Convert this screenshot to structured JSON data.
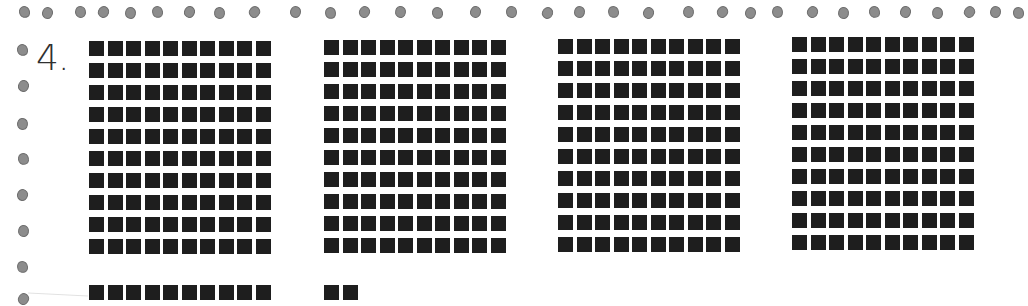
{
  "worksheet": {
    "problem_number": "4.",
    "representation": "base-ten blocks",
    "hundreds": 4,
    "tens": 1,
    "ones": 2,
    "block_color": "#1e1e1e",
    "border_dot_color": "#8c8c8c"
  },
  "blocks": {
    "hundreds": [
      {
        "left": 89,
        "top": 41
      },
      {
        "left": 324,
        "top": 40
      },
      {
        "left": 558,
        "top": 39
      },
      {
        "left": 792,
        "top": 37
      }
    ],
    "ten_rod": {
      "left": 89,
      "top": 285
    },
    "ones": {
      "left": 324,
      "top": 285
    }
  },
  "border": {
    "top_dots_x": [
      19,
      42,
      75,
      98,
      125,
      152,
      184,
      214,
      249,
      290,
      325,
      359,
      395,
      432,
      470,
      506,
      542,
      574,
      608,
      643,
      683,
      717,
      745,
      772,
      807,
      838,
      869,
      900,
      932,
      964,
      990,
      1013
    ],
    "left_dots_y": [
      44,
      80,
      118,
      153,
      189,
      225,
      261,
      293
    ]
  }
}
